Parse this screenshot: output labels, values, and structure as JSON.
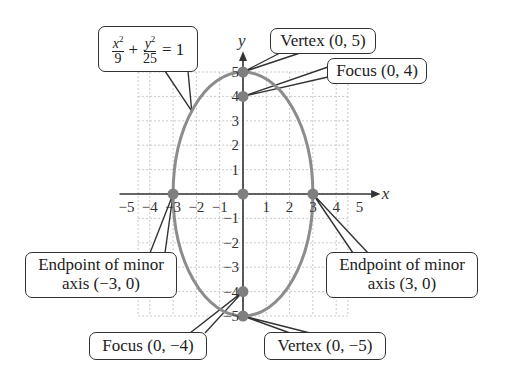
{
  "figure": {
    "colors": {
      "ellipse": "#8c8c8c",
      "points": "#7f7f7f",
      "axes": "#333333",
      "grid": "#c8c8c8",
      "callout_border": "#333333",
      "text": "#222222"
    }
  },
  "chart_data": {
    "type": "scatter",
    "title": "",
    "xlabel": "x",
    "ylabel": "y",
    "xlim": [
      -5,
      5
    ],
    "ylim": [
      -5,
      5
    ],
    "grid": true,
    "x_ticks": [
      "−5",
      "−4",
      "−3",
      "−2",
      "−1",
      "1",
      "2",
      "3",
      "4",
      "5"
    ],
    "y_ticks": [
      "5",
      "4",
      "3",
      "2",
      "1",
      "−1",
      "−2",
      "−3",
      "−4",
      "−5"
    ],
    "curve": {
      "equation": "x^2/9 + y^2/25 = 1",
      "a": 3,
      "b": 5,
      "center": [
        0,
        0
      ]
    },
    "points": [
      {
        "label": "Vertex (0, 5)",
        "x": 0,
        "y": 5
      },
      {
        "label": "Focus (0, 4)",
        "x": 0,
        "y": 4
      },
      {
        "label": "Center",
        "x": 0,
        "y": 0
      },
      {
        "label": "Endpoint of minor axis (−3, 0)",
        "x": -3,
        "y": 0
      },
      {
        "label": "Endpoint of minor axis (3, 0)",
        "x": 3,
        "y": 0
      },
      {
        "label": "Focus (0, −4)",
        "x": 0,
        "y": -4
      },
      {
        "label": "Vertex (0, −5)",
        "x": 0,
        "y": -5
      }
    ]
  },
  "axes": {
    "x_label": "x",
    "y_label": "y",
    "x_ticks": [
      {
        "v": -5,
        "t": "−5"
      },
      {
        "v": -4,
        "t": "−4"
      },
      {
        "v": -3,
        "t": "−3"
      },
      {
        "v": -2,
        "t": "−2"
      },
      {
        "v": -1,
        "t": "−1"
      },
      {
        "v": 1,
        "t": "1"
      },
      {
        "v": 2,
        "t": "2"
      },
      {
        "v": 3,
        "t": "3"
      },
      {
        "v": 4,
        "t": "4"
      },
      {
        "v": 5,
        "t": "5"
      }
    ],
    "y_ticks": [
      {
        "v": 5,
        "t": "5"
      },
      {
        "v": 4,
        "t": "4"
      },
      {
        "v": 3,
        "t": "3"
      },
      {
        "v": 2,
        "t": "2"
      },
      {
        "v": 1,
        "t": "1"
      },
      {
        "v": -1,
        "t": "−1"
      },
      {
        "v": -2,
        "t": "−2"
      },
      {
        "v": -3,
        "t": "−3"
      },
      {
        "v": -4,
        "t": "−4"
      },
      {
        "v": -5,
        "t": "−5"
      }
    ]
  },
  "callouts": {
    "equation": {
      "x_num": "x",
      "x_exp": "2",
      "x_den": "9",
      "plus": "+",
      "y_num": "y",
      "y_exp": "2",
      "y_den": "25",
      "equals": "= 1"
    },
    "vertex_top": "Vertex (0, 5)",
    "focus_top": "Focus (0, 4)",
    "minor_left_line1": "Endpoint of minor",
    "minor_left_line2": "axis (−3, 0)",
    "minor_right_line1": "Endpoint of minor",
    "minor_right_line2": "axis (3, 0)",
    "focus_bottom": "Focus (0, −4)",
    "vertex_bottom": "Vertex (0, −5)"
  }
}
